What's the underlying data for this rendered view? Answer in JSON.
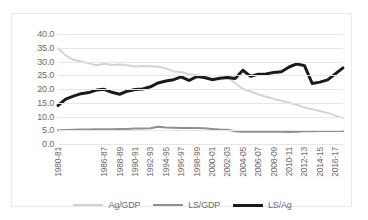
{
  "chart_data": {
    "type": "line",
    "title": "",
    "xlabel": "",
    "ylabel": "",
    "ylim": [
      0.0,
      40.0
    ],
    "ytick_step": 5.0,
    "yticks": [
      "0.0",
      "5.0",
      "10.0",
      "15.0",
      "20.0",
      "25.0",
      "30.0",
      "35.0",
      "40.0"
    ],
    "grid": true,
    "legend_position": "bottom",
    "x": [
      "1980-81",
      "1981-82",
      "1982-83",
      "1983-84",
      "1984-85",
      "1985-86",
      "1986-87",
      "1987-88",
      "1988-89",
      "1989-90",
      "1990-91",
      "1991-92",
      "1992-93",
      "1993-94",
      "1994-95",
      "1995-96",
      "1996-97",
      "1997-98",
      "1998-99",
      "1999-00",
      "2000-01",
      "2001-02",
      "2002-03",
      "2003-04",
      "2004-05",
      "2005-06",
      "2006-07",
      "2007-08",
      "2008-09",
      "2009-10",
      "2010-11",
      "2011-12",
      "2012-13",
      "2013-14",
      "2014-15",
      "2015-16",
      "2016-17",
      "2017-18"
    ],
    "xtick_labels": [
      "1980-81",
      "1986-87",
      "1988-89",
      "1990-91",
      "1992-93",
      "1994-95",
      "1996-97",
      "1998-99",
      "2000-01",
      "2002-03",
      "2004-05",
      "2006-07",
      "2008-09",
      "2010-11",
      "2012-13",
      "2014-15",
      "2016-17"
    ],
    "xtick_indices": [
      0,
      6,
      8,
      10,
      12,
      14,
      16,
      18,
      20,
      22,
      24,
      26,
      28,
      30,
      32,
      34,
      36
    ],
    "series": [
      {
        "name": "Ag/GDP",
        "color": "#d4d4d4",
        "width": 2.0,
        "values": [
          34.8,
          32.2,
          30.6,
          30.0,
          29.4,
          28.6,
          29.2,
          28.7,
          28.9,
          28.6,
          28.2,
          28.4,
          28.3,
          28.1,
          27.5,
          26.4,
          26.2,
          25.3,
          25.1,
          24.5,
          23.9,
          23.5,
          24.4,
          22.2,
          20.0,
          19.1,
          18.1,
          17.2,
          16.4,
          15.7,
          15.0,
          14.3,
          13.3,
          12.6,
          12.0,
          11.3,
          10.3,
          9.4
        ]
      },
      {
        "name": "LS/GDP",
        "color": "#909090",
        "width": 2.0,
        "values": [
          5.0,
          5.1,
          5.2,
          5.3,
          5.3,
          5.4,
          5.4,
          5.4,
          5.5,
          5.5,
          5.6,
          5.6,
          5.7,
          6.3,
          6.0,
          5.9,
          5.8,
          5.8,
          5.8,
          5.7,
          5.5,
          5.3,
          5.2,
          4.6,
          4.5,
          4.5,
          4.5,
          4.5,
          4.5,
          4.5,
          4.4,
          4.5,
          4.6,
          4.6,
          4.7,
          4.7,
          4.7,
          4.7
        ]
      },
      {
        "name": "LS/Ag",
        "color": "#1a1a1a",
        "width": 3.0,
        "values": [
          14.0,
          16.3,
          17.4,
          18.3,
          18.7,
          19.6,
          19.9,
          18.8,
          18.1,
          19.2,
          19.8,
          20.0,
          20.8,
          22.2,
          22.9,
          23.4,
          24.4,
          23.1,
          24.5,
          24.2,
          23.4,
          23.9,
          24.2,
          23.8,
          26.8,
          24.6,
          25.4,
          25.5,
          26.0,
          26.3,
          28.0,
          29.1,
          28.5,
          22.0,
          22.5,
          23.3,
          25.5,
          27.7
        ]
      }
    ]
  },
  "legend": {
    "items": [
      {
        "label": "Ag/GDP",
        "color": "#d4d4d4",
        "width": 2.0
      },
      {
        "label": "LS/GDP",
        "color": "#909090",
        "width": 2.5
      },
      {
        "label": "LS/Ag",
        "color": "#1a1a1a",
        "width": 3.5
      }
    ]
  }
}
